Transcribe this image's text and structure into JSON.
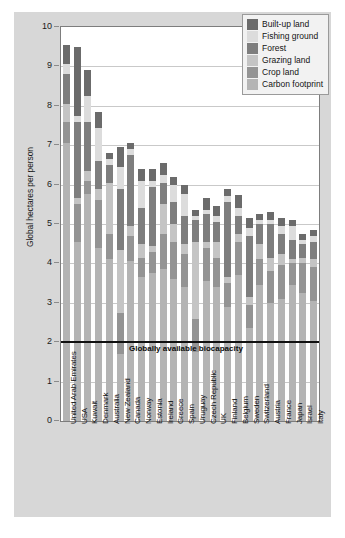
{
  "chart": {
    "ylabel": "Global hectares per person",
    "yticks": [
      "0",
      "1",
      "2",
      "3",
      "4",
      "5",
      "6",
      "7",
      "8",
      "9",
      "10"
    ],
    "annotation": "Globally available biocapacity"
  },
  "legend": {
    "items": [
      {
        "label": "Built-up land",
        "color": "#6b6b6b"
      },
      {
        "label": "Fishing ground",
        "color": "#dcdcdc"
      },
      {
        "label": "Forest",
        "color": "#7e7e7e"
      },
      {
        "label": "Grazing land",
        "color": "#c4c4c4"
      },
      {
        "label": "Crop land",
        "color": "#949494"
      },
      {
        "label": "Carbon footprint",
        "color": "#b4b4b4"
      }
    ]
  },
  "chart_data": {
    "type": "bar",
    "subtype": "stacked-bar",
    "title": "",
    "xlabel": "",
    "ylabel": "Global hectares per person",
    "ylim": [
      0,
      10
    ],
    "yticks": [
      0,
      1,
      2,
      3,
      4,
      5,
      6,
      7,
      8,
      9,
      10
    ],
    "grid": true,
    "legend_position": "top-right",
    "annotation_line": {
      "label": "Globally available biocapacity",
      "y": 2.0
    },
    "series_order": [
      "Carbon footprint",
      "Crop land",
      "Grazing land",
      "Forest",
      "Fishing ground",
      "Built-up land"
    ],
    "colors": {
      "Carbon footprint": "#b4b4b4",
      "Crop land": "#949494",
      "Grazing land": "#c4c4c4",
      "Forest": "#7e7e7e",
      "Fishing ground": "#dcdcdc",
      "Built-up land": "#6b6b6b"
    },
    "categories": [
      "United Arab Emirates",
      "USA",
      "Kuwait",
      "Denmark",
      "Australia",
      "New Zealand",
      "Canada",
      "Norway",
      "Estonia",
      "Ireland",
      "Greece",
      "Spain",
      "Uruguay",
      "Czech Republic",
      "UK",
      "Finland",
      "Belgium",
      "Sweden",
      "Switzerland",
      "Austria",
      "France",
      "Japan",
      "Israel",
      "Italy"
    ],
    "series": [
      {
        "name": "Carbon footprint",
        "values": [
          7.05,
          4.55,
          5.75,
          4.4,
          4.1,
          1.7,
          4.05,
          3.65,
          3.75,
          3.85,
          3.6,
          3.4,
          1.75,
          3.55,
          3.4,
          2.9,
          3.7,
          2.35,
          3.45,
          3.0,
          3.1,
          3.45,
          3.25,
          3.05
        ]
      },
      {
        "name": "Crop land",
        "values": [
          0.55,
          0.95,
          0.35,
          1.2,
          0.65,
          1.05,
          0.65,
          0.5,
          0.55,
          0.9,
          0.95,
          0.85,
          0.85,
          0.85,
          0.75,
          0.6,
          0.85,
          0.6,
          0.65,
          0.8,
          0.85,
          0.55,
          0.75,
          0.85
        ]
      },
      {
        "name": "Grazing land",
        "values": [
          0.45,
          0.15,
          0.25,
          0.3,
          1.3,
          1.6,
          0.25,
          0.35,
          0.15,
          0.75,
          0.45,
          0.25,
          1.95,
          0.15,
          0.4,
          0.15,
          0.2,
          0.2,
          0.4,
          0.35,
          0.3,
          0.1,
          0.15,
          0.2
        ]
      },
      {
        "name": "Forest",
        "values": [
          0.75,
          1.95,
          1.25,
          0.7,
          0.45,
          1.55,
          1.8,
          0.9,
          1.5,
          0.55,
          0.55,
          0.7,
          0.55,
          0.7,
          0.5,
          1.9,
          0.45,
          1.55,
          0.5,
          0.85,
          0.5,
          0.5,
          0.35,
          0.45
        ]
      },
      {
        "name": "Fishing ground",
        "values": [
          0.25,
          0.15,
          0.65,
          0.85,
          0.15,
          0.55,
          0.15,
          0.7,
          0.15,
          0.2,
          0.45,
          0.55,
          0.1,
          0.1,
          0.15,
          0.15,
          0.2,
          0.2,
          0.1,
          0.1,
          0.2,
          0.35,
          0.1,
          0.15
        ]
      },
      {
        "name": "Built-up land",
        "values": [
          0.5,
          1.75,
          0.65,
          0.4,
          0.15,
          0.5,
          0.15,
          0.3,
          0.3,
          0.3,
          0.2,
          0.25,
          0.15,
          0.3,
          0.25,
          0.2,
          0.35,
          0.25,
          0.15,
          0.2,
          0.2,
          0.15,
          0.15,
          0.15
        ]
      }
    ],
    "totals": [
      9.55,
      9.5,
      8.9,
      7.85,
      6.8,
      6.95,
      7.05,
      6.4,
      6.4,
      6.55,
      6.2,
      6.0,
      5.35,
      5.65,
      5.45,
      5.9,
      5.75,
      5.15,
      5.25,
      5.3,
      5.15,
      5.1,
      4.75,
      4.85
    ]
  }
}
